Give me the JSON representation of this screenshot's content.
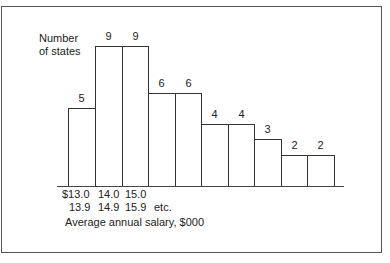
{
  "chart_data": {
    "type": "bar",
    "title": "",
    "ylabel": "Number of states",
    "xlabel": "Average annual salary, $000",
    "categories": [
      "$13.0-13.9",
      "14.0-14.9",
      "15.0-15.9",
      "16.0-16.9",
      "17.0-17.9",
      "18.0-18.9",
      "19.0-19.9",
      "20.0-20.9",
      "21.0-21.9",
      "22.0-22.9"
    ],
    "values": [
      5,
      9,
      9,
      6,
      6,
      4,
      4,
      3,
      2,
      2
    ],
    "tick_labels_shown": [
      {
        "top": "$13.0",
        "bottom": "13.9"
      },
      {
        "top": "14.0",
        "bottom": "14.9"
      },
      {
        "top": "15.0",
        "bottom": "15.9"
      }
    ],
    "tick_suffix": "etc.",
    "ylim": [
      0,
      9
    ],
    "grid": false,
    "legend": null
  },
  "labels": {
    "ylabel_line1": "Number",
    "ylabel_line2": "of states",
    "xlabel": "Average annual salary, $000",
    "ticks": [
      {
        "top": "$13.0",
        "bottom": "13.9"
      },
      {
        "top": "14.0",
        "bottom": "14.9"
      },
      {
        "top": "15.0",
        "bottom": "15.9"
      }
    ],
    "etc": "etc.",
    "values": [
      "5",
      "9",
      "9",
      "6",
      "6",
      "4",
      "4",
      "3",
      "2",
      "2"
    ]
  }
}
